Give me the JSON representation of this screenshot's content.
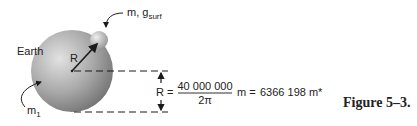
{
  "labels": {
    "earth": "Earth",
    "radius_vector": "R",
    "earth_mass": "m",
    "earth_mass_sub": "1",
    "small_mass": "m, g",
    "small_mass_sub": "surf"
  },
  "equation": {
    "lhs": "R =",
    "numerator": "40 000 000",
    "denominator": "2π",
    "unit": "m =",
    "result": "6366 198 m*"
  },
  "caption": "Figure 5–3.",
  "colors": {
    "earth_light": "#d8d8d8",
    "earth_dark": "#7a7a7a",
    "line": "#1a1a1a"
  }
}
